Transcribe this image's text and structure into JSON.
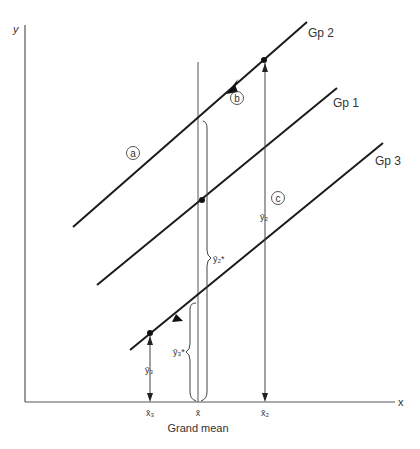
{
  "axes": {
    "x_label": "x",
    "y_label": "y"
  },
  "groups": [
    {
      "name": "Gp 2",
      "label": "Gp 2"
    },
    {
      "name": "Gp 1",
      "label": "Gp 1"
    },
    {
      "name": "Gp 3",
      "label": "Gp 3"
    }
  ],
  "annotations": {
    "a": "a",
    "b": "b",
    "c": "c",
    "y2_bar": "ȳ₂",
    "y3_bar": "ȳ₃",
    "y2_star": "ȳ₂*",
    "y3_star": "ȳ₃*"
  },
  "x_ticks": {
    "x3": "x̄₃",
    "x_grand": "x̄",
    "x2": "x̄₂"
  },
  "caption": "Grand mean",
  "colors": {
    "line": "#1a1a1a",
    "thin_line": "#555555",
    "text": "#333333"
  }
}
